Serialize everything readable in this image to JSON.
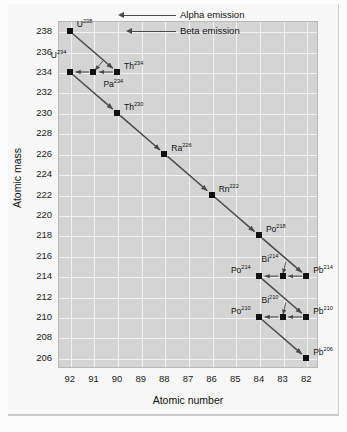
{
  "chart_data": {
    "type": "scatter",
    "title": "",
    "xlabel": "Atomic number",
    "ylabel": "Atomic mass",
    "xticks": [
      92,
      91,
      90,
      89,
      88,
      87,
      86,
      85,
      84,
      83,
      82
    ],
    "yticks": [
      238,
      236,
      234,
      232,
      230,
      228,
      226,
      224,
      222,
      220,
      218,
      216,
      214,
      212,
      210,
      208,
      206
    ],
    "xlim": [
      92.5,
      81.5
    ],
    "ylim": [
      205,
      239
    ],
    "x_reversed": true,
    "grid": true,
    "grid_color": "#f2f2f2",
    "plot_bg": "#d4d4d4",
    "marker_color": "#111111",
    "arrow_color": "#4a4a4a",
    "legend": {
      "position": "top-right-inside",
      "entries": [
        {
          "name": "alpha-emission",
          "label": "Alpha emission",
          "arrow": "long"
        },
        {
          "name": "beta-emission",
          "label": "Beta emission",
          "arrow": "short"
        }
      ]
    },
    "points": [
      {
        "id": "U238",
        "element": "U",
        "mass": 238,
        "z": 92,
        "label_text": "U",
        "label_sup": "238",
        "label_pos": "above-right"
      },
      {
        "id": "Th234",
        "element": "Th",
        "mass": 234,
        "z": 90,
        "label_text": "Th",
        "label_sup": "234",
        "label_pos": "right"
      },
      {
        "id": "Pa234",
        "element": "Pa",
        "mass": 234,
        "z": 91,
        "label_text": "Pa",
        "label_sup": "234",
        "label_pos": "below-right"
      },
      {
        "id": "U234",
        "element": "U",
        "mass": 234,
        "z": 92,
        "label_text": "U",
        "label_sup": "234",
        "label_pos": "above-left"
      },
      {
        "id": "Th230",
        "element": "Th",
        "mass": 230,
        "z": 90,
        "label_text": "Th",
        "label_sup": "230",
        "label_pos": "right"
      },
      {
        "id": "Ra226",
        "element": "Ra",
        "mass": 226,
        "z": 88,
        "label_text": "Ra",
        "label_sup": "226",
        "label_pos": "right"
      },
      {
        "id": "Rn222",
        "element": "Rn",
        "mass": 222,
        "z": 86,
        "label_text": "Rn",
        "label_sup": "222",
        "label_pos": "right"
      },
      {
        "id": "Po218",
        "element": "Po",
        "mass": 218,
        "z": 84,
        "label_text": "Po",
        "label_sup": "218",
        "label_pos": "right"
      },
      {
        "id": "Pb214",
        "element": "Pb",
        "mass": 214,
        "z": 82,
        "label_text": "Pb",
        "label_sup": "214",
        "label_pos": "right"
      },
      {
        "id": "Bi214",
        "element": "Bi",
        "mass": 214,
        "z": 83,
        "label_text": "Bi",
        "label_sup": "214",
        "label_pos": "above-left"
      },
      {
        "id": "Po214",
        "element": "Po",
        "mass": 214,
        "z": 84,
        "label_text": "Po",
        "label_sup": "214",
        "label_pos": "left"
      },
      {
        "id": "Pb210",
        "element": "Pb",
        "mass": 210,
        "z": 82,
        "label_text": "Pb",
        "label_sup": "210",
        "label_pos": "right"
      },
      {
        "id": "Bi210",
        "element": "Bi",
        "mass": 210,
        "z": 83,
        "label_text": "Bi",
        "label_sup": "210",
        "label_pos": "above-left"
      },
      {
        "id": "Po210",
        "element": "Po",
        "mass": 210,
        "z": 84,
        "label_text": "Po",
        "label_sup": "210",
        "label_pos": "left"
      },
      {
        "id": "Pb206",
        "element": "Pb",
        "mass": 206,
        "z": 82,
        "label_text": "Pb",
        "label_sup": "206",
        "label_pos": "right"
      }
    ],
    "transitions": [
      {
        "from": "U238",
        "to": "Th234",
        "type": "alpha"
      },
      {
        "from": "Th234",
        "to": "Pa234",
        "type": "beta"
      },
      {
        "from": "Pa234",
        "to": "U234",
        "type": "beta"
      },
      {
        "from": "U234",
        "to": "Th230",
        "type": "alpha"
      },
      {
        "from": "Th230",
        "to": "Ra226",
        "type": "alpha"
      },
      {
        "from": "Ra226",
        "to": "Rn222",
        "type": "alpha"
      },
      {
        "from": "Rn222",
        "to": "Po218",
        "type": "alpha"
      },
      {
        "from": "Po218",
        "to": "Pb214",
        "type": "alpha"
      },
      {
        "from": "Pb214",
        "to": "Bi214",
        "type": "beta"
      },
      {
        "from": "Bi214",
        "to": "Po214",
        "type": "beta"
      },
      {
        "from": "Po214",
        "to": "Pb210",
        "type": "alpha"
      },
      {
        "from": "Pb210",
        "to": "Bi210",
        "type": "beta"
      },
      {
        "from": "Bi210",
        "to": "Po210",
        "type": "beta"
      },
      {
        "from": "Po210",
        "to": "Pb206",
        "type": "alpha"
      }
    ]
  }
}
